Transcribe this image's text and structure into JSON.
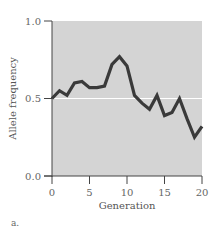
{
  "chart_data": {
    "type": "line",
    "title": "",
    "xlabel": "Generation",
    "ylabel": "Allele frequency",
    "xlim": [
      0,
      20
    ],
    "ylim": [
      0.0,
      1.0
    ],
    "xticks": [
      0,
      5,
      10,
      15,
      20
    ],
    "yticks": [
      0.0,
      0.5,
      1.0
    ],
    "ytick_labels": [
      "0.0",
      "0.5",
      "1.0"
    ],
    "reference_line": 0.5,
    "grid": false,
    "legend": null,
    "series": [
      {
        "name": "Allele frequency",
        "x": [
          0,
          1,
          2,
          3,
          4,
          5,
          6,
          7,
          8,
          9,
          10,
          11,
          12,
          13,
          14,
          15,
          16,
          17,
          18,
          19,
          20
        ],
        "values": [
          0.5,
          0.55,
          0.52,
          0.6,
          0.61,
          0.57,
          0.57,
          0.58,
          0.72,
          0.77,
          0.71,
          0.52,
          0.47,
          0.43,
          0.52,
          0.39,
          0.41,
          0.5,
          0.37,
          0.25,
          0.32
        ]
      }
    ]
  },
  "colors": {
    "plot_background": "#d4d4d4",
    "line": "#3a3a3a",
    "reference_line": "#ffffff",
    "axis": "#444444"
  },
  "panel_label": "a."
}
